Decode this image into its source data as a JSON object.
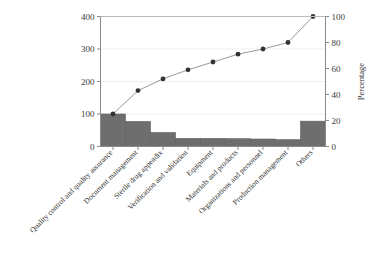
{
  "chart_data": {
    "type": "bar",
    "title": "",
    "subtitle": "",
    "xlabel": "",
    "ylabel": "",
    "y2label": "Percentage",
    "categories": [
      "Quality control and quality assurance",
      "Document management",
      "Sterile drug appendix",
      "Verification and validation",
      "Equipment",
      "Materials and products",
      "Organizations and personnel",
      "Production management",
      "Others"
    ],
    "values": [
      100,
      77,
      43,
      25,
      25,
      24,
      23,
      21,
      78
    ],
    "cumulative_percent": [
      25,
      43,
      52,
      59,
      65,
      71,
      75,
      80,
      100
    ],
    "ylim": [
      0,
      400
    ],
    "y2lim": [
      0,
      100
    ],
    "yticks": [
      0,
      100,
      200,
      300,
      400
    ],
    "y2ticks": [
      0,
      20,
      40,
      60,
      80,
      100
    ],
    "ytick_labels": [
      "0",
      "100",
      "200",
      "300",
      "400"
    ],
    "y2tick_labels": [
      "0",
      "20",
      "40",
      "60",
      "80",
      "100"
    ],
    "grid": true,
    "legend": "none",
    "series": [
      {
        "name": "Count",
        "type": "bar",
        "values": [
          100,
          77,
          43,
          25,
          25,
          24,
          23,
          21,
          78
        ],
        "color": "#6e6e6e"
      },
      {
        "name": "Cumulative percentage",
        "type": "line",
        "values": [
          25,
          43,
          52,
          59,
          65,
          71,
          75,
          80,
          100
        ],
        "color": "#999999",
        "marker_color": "#333333"
      }
    ]
  },
  "colors": {
    "bar": "#6e6e6e",
    "line": "#999999",
    "marker": "#333333",
    "axis": "#8a8a8a",
    "grid": "#efefef",
    "background": "#ffffff"
  }
}
